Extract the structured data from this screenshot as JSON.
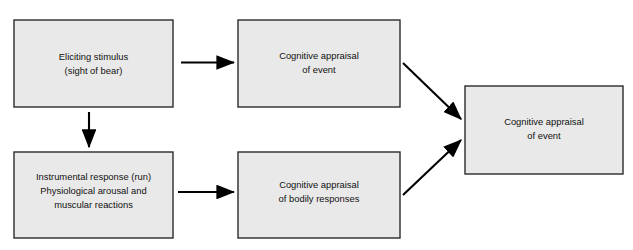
{
  "diagram": {
    "background_color": "#ffffff",
    "box_fill_color": "#e9e9e9",
    "box_border_color": "#2b2b2b",
    "arrow_color": "#000000",
    "nodes": [
      {
        "id": "eliciting-stimulus",
        "lines": [
          "Eliciting stimulus",
          "(sight of bear)"
        ],
        "line1": "Eliciting stimulus",
        "line2": "(sight of bear)",
        "line3": "",
        "x": 14,
        "y": 20,
        "w": 159,
        "h": 87
      },
      {
        "id": "cognitive-appraisal-of-event-top",
        "lines": [
          "Cognitive appraisal",
          "of event"
        ],
        "line1": "Cognitive appraisal",
        "line2": "of event",
        "line3": "",
        "x": 238,
        "y": 20,
        "w": 162,
        "h": 87
      },
      {
        "id": "instrumental-response",
        "lines": [
          "Instrumental response (run)",
          "Physiological arousal and",
          "muscular reactions"
        ],
        "line1": "Instrumental response (run)",
        "line2": "Physiological arousal and",
        "line3": "muscular reactions",
        "x": 14,
        "y": 152,
        "w": 159,
        "h": 86
      },
      {
        "id": "cognitive-appraisal-of-bodily-responses",
        "lines": [
          "Cognitive appraisal",
          "of bodily responses"
        ],
        "line1": "Cognitive appraisal",
        "line2": "of bodily responses",
        "line3": "",
        "x": 238,
        "y": 152,
        "w": 162,
        "h": 86
      },
      {
        "id": "cognitive-appraisal-of-event-right",
        "lines": [
          "Cognitive appraisal",
          "of event"
        ],
        "line1": "Cognitive appraisal",
        "line2": "of event",
        "line3": "",
        "x": 465,
        "y": 86,
        "w": 158,
        "h": 88
      }
    ],
    "edges": [
      {
        "id": "stimulus-to-appraisal-event",
        "from": "eliciting-stimulus",
        "to": "cognitive-appraisal-of-event-top",
        "kind": "horizontal"
      },
      {
        "id": "stimulus-to-instrumental-response",
        "from": "eliciting-stimulus",
        "to": "instrumental-response",
        "kind": "vertical"
      },
      {
        "id": "instrumental-response-to-bodily-appraisal",
        "from": "instrumental-response",
        "to": "cognitive-appraisal-of-bodily-responses",
        "kind": "horizontal"
      },
      {
        "id": "appraisal-event-to-final",
        "from": "cognitive-appraisal-of-event-top",
        "to": "cognitive-appraisal-of-event-right",
        "kind": "diagonal-down"
      },
      {
        "id": "bodily-appraisal-to-final",
        "from": "cognitive-appraisal-of-bodily-responses",
        "to": "cognitive-appraisal-of-event-right",
        "kind": "diagonal-up"
      }
    ]
  }
}
